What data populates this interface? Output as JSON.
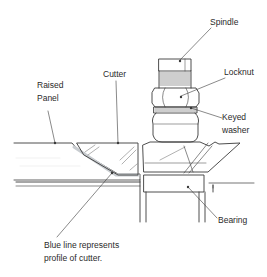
{
  "diagram": {
    "labels": {
      "spindle": "Spindle",
      "locknut": "Locknut",
      "keyed_washer": "Keyed\nwasher",
      "cutter": "Cutter",
      "raised_panel": "Raised\nPanel",
      "bearing": "Bearing",
      "caption": "Blue line represents\nprofile of cutter."
    },
    "colors": {
      "line": "#3a3a3a",
      "profile": "#c8ccd0",
      "text": "#2a2a2a"
    }
  }
}
